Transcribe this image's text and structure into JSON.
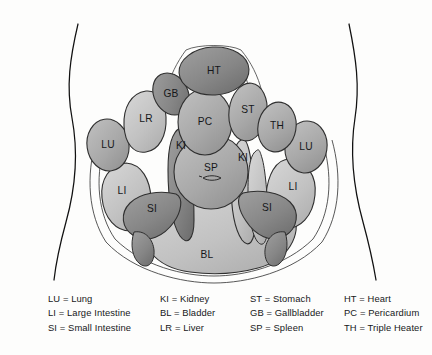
{
  "diagram": {
    "body_outline_color": "#111111",
    "background_color": "#fdfdfc",
    "organs": [
      {
        "code": "HT",
        "name": "Heart",
        "shade": "dark",
        "cx": 214,
        "cy": 71
      },
      {
        "code": "GB",
        "name": "Gallbladder",
        "shade": "dark",
        "cx": 171,
        "cy": 94
      },
      {
        "code": "LR",
        "name": "Liver",
        "shade": "light",
        "cx": 146,
        "cy": 119
      },
      {
        "code": "PC",
        "name": "Pericardium",
        "shade": "medium",
        "cx": 205,
        "cy": 122
      },
      {
        "code": "ST",
        "name": "Stomach",
        "shade": "medium",
        "cx": 248,
        "cy": 110
      },
      {
        "code": "TH",
        "name": "Triple Heater",
        "shade": "medium",
        "cx": 276,
        "cy": 126
      },
      {
        "code": "LU",
        "name": "Lung",
        "shade": "medium",
        "cx": 108,
        "cy": 145
      },
      {
        "code": "LU",
        "name": "Lung",
        "shade": "medium",
        "cx": 305,
        "cy": 147
      },
      {
        "code": "KI",
        "name": "Kidney",
        "shade": "dark",
        "cx": 182,
        "cy": 146
      },
      {
        "code": "KI",
        "name": "Kidney",
        "shade": "light",
        "cx": 240,
        "cy": 158
      },
      {
        "code": "SP",
        "name": "Spleen",
        "shade": "medium",
        "cx": 211,
        "cy": 170
      },
      {
        "code": "LI",
        "name": "Large Intestine",
        "shade": "light",
        "cx": 120,
        "cy": 190
      },
      {
        "code": "LI",
        "name": "Large Intestine",
        "shade": "light",
        "cx": 292,
        "cy": 186
      },
      {
        "code": "SI",
        "name": "Small Intestine",
        "shade": "dark",
        "cx": 151,
        "cy": 207
      },
      {
        "code": "SI",
        "name": "Small Intestine",
        "shade": "dark",
        "cx": 267,
        "cy": 206
      },
      {
        "code": "BL",
        "name": "Bladder",
        "shade": "light",
        "cx": 206,
        "cy": 254
      }
    ]
  },
  "legend": {
    "columns": [
      [
        "LU = Lung",
        "LI = Large Intestine",
        "SI = Small Intestine"
      ],
      [
        "KI = Kidney",
        "BL = Bladder",
        "LR = Liver"
      ],
      [
        "ST = Stomach",
        "GB = Gallbladder",
        "SP = Spleen"
      ],
      [
        "HT = Heart",
        "PC = Pericardium",
        "TH = Triple Heater"
      ]
    ]
  }
}
